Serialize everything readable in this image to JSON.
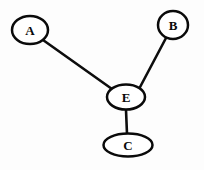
{
  "diagram": {
    "type": "node-link-graph",
    "background_color": "#fdfdfd",
    "stroke_color": "#0a0a0a",
    "node_fill_color": "#ffffff",
    "edge_color": "#0d0d0d",
    "nodes": [
      {
        "id": "A",
        "label": "A",
        "cx": 30,
        "cy": 30,
        "rx": 18,
        "ry": 14,
        "role": "leaf"
      },
      {
        "id": "B",
        "label": "B",
        "cx": 173,
        "cy": 25,
        "rx": 15,
        "ry": 14,
        "role": "leaf"
      },
      {
        "id": "E",
        "label": "E",
        "cx": 126,
        "cy": 97,
        "rx": 19,
        "ry": 12.5,
        "role": "hub"
      },
      {
        "id": "C",
        "label": "C",
        "cx": 128,
        "cy": 145,
        "rx": 24.5,
        "ry": 11.5,
        "role": "leaf"
      }
    ],
    "edges": [
      {
        "id": "A-E",
        "from": "A",
        "to": "E",
        "x1": 43,
        "y1": 40,
        "x2": 112,
        "y2": 89
      },
      {
        "id": "B-E",
        "from": "B",
        "to": "E",
        "x1": 166,
        "y1": 38,
        "x2": 139,
        "y2": 89
      },
      {
        "id": "E-C",
        "from": "E",
        "to": "C",
        "x1": 126,
        "y1": 110,
        "x2": 127,
        "y2": 134
      }
    ]
  }
}
